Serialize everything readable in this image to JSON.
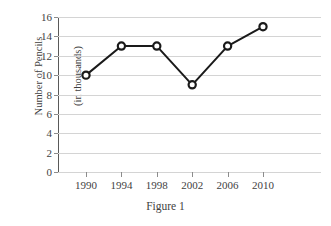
{
  "chart_data": {
    "type": "line",
    "title": "",
    "caption": "Figure 1",
    "xlabel": "",
    "ylabel": "Number of Pencils (in thousands)",
    "ylabel_line1": "Number of Pencils",
    "ylabel_line2": "(in thousands)",
    "categories": [
      "1990",
      "1994",
      "1998",
      "2002",
      "2006",
      "2010"
    ],
    "x": [
      1990,
      1994,
      1998,
      2002,
      2006,
      2010
    ],
    "values": [
      10,
      13,
      13,
      9,
      13,
      15
    ],
    "series": [
      {
        "name": "Number of Pencils",
        "values": [
          10,
          13,
          13,
          9,
          13,
          15
        ]
      }
    ],
    "ylim": [
      0,
      16
    ],
    "yticks": [
      0,
      2,
      4,
      6,
      8,
      10,
      12,
      14,
      16
    ],
    "ytick_labels": [
      "0",
      "2",
      "4",
      "6",
      "8",
      "10",
      "12",
      "14",
      "16"
    ],
    "grid": true,
    "grid_axis": "y",
    "legend": false,
    "legend_position": "none",
    "marker": "open-circle",
    "line_color": "#1a1a1a",
    "marker_fill": "#ffffff",
    "marker_edge": "#1a1a1a",
    "grid_color": "#d4d4d4",
    "axis_color": "#595959",
    "text_color": "#3f3f3f",
    "background": "#ffffff"
  }
}
